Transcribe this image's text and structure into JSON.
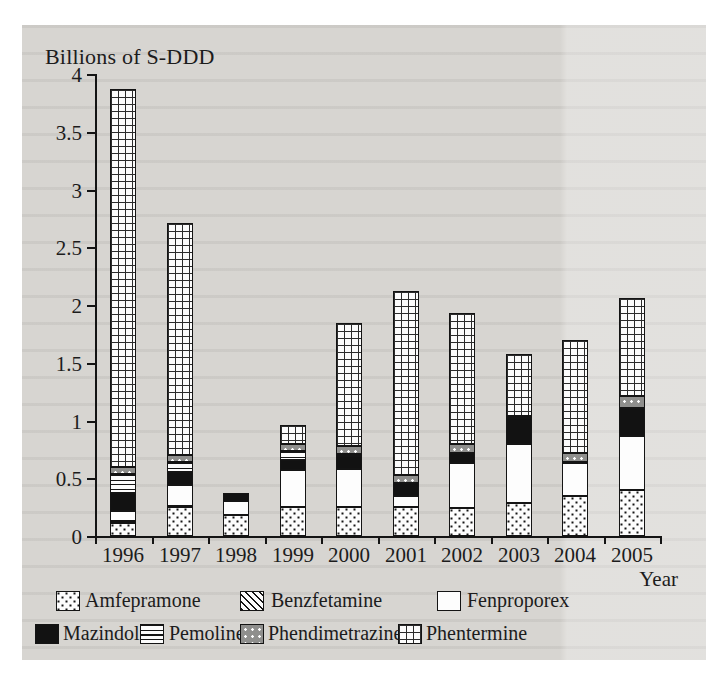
{
  "page": {
    "yaxis_title": "Billions of S-DDD",
    "xaxis_title": "Year"
  },
  "chart_data": {
    "type": "bar",
    "stacked": true,
    "title": "Billions of S-DDD",
    "xlabel": "Year",
    "ylabel": "Billions of S-DDD",
    "ylim": [
      0,
      4
    ],
    "yticks": [
      "0",
      "0.5",
      "1",
      "1.5",
      "2",
      "2.5",
      "3",
      "3.5",
      "4"
    ],
    "grid": false,
    "legend_position": "bottom",
    "categories": [
      "1996",
      "1997",
      "1998",
      "1999",
      "2000",
      "2001",
      "2002",
      "2003",
      "2004",
      "2005"
    ],
    "series": [
      {
        "name": "Amfepramone",
        "pattern": "dots-black-on-white",
        "values": [
          0.11,
          0.25,
          0.18,
          0.25,
          0.25,
          0.25,
          0.24,
          0.29,
          0.35,
          0.4
        ]
      },
      {
        "name": "Benzfetamine",
        "pattern": "diagonal-hatch",
        "values": [
          0.02,
          0.01,
          0,
          0,
          0,
          0,
          0,
          0,
          0,
          0
        ]
      },
      {
        "name": "Fenproporex",
        "pattern": "white",
        "values": [
          0.09,
          0.18,
          0.12,
          0.32,
          0.33,
          0.1,
          0.39,
          0.51,
          0.28,
          0.47
        ]
      },
      {
        "name": "Mazindol",
        "pattern": "solid-black",
        "values": [
          0.15,
          0.11,
          0.07,
          0.09,
          0.11,
          0.11,
          0.09,
          0.22,
          0.01,
          0.24
        ]
      },
      {
        "name": "Pemoline",
        "pattern": "horizontal-lines",
        "values": [
          0.17,
          0.09,
          0,
          0.08,
          0.02,
          0,
          0,
          0,
          0,
          0
        ]
      },
      {
        "name": "Phendimetrazine",
        "pattern": "gray-white-dots",
        "values": [
          0.06,
          0.06,
          0,
          0.06,
          0.07,
          0.07,
          0.08,
          0.02,
          0.08,
          0.1
        ]
      },
      {
        "name": "Phentermine",
        "pattern": "grid",
        "values": [
          3.27,
          2.01,
          0,
          0.16,
          1.06,
          1.59,
          1.13,
          0.54,
          0.98,
          0.85
        ]
      }
    ],
    "totals": [
      3.87,
      2.71,
      0.37,
      0.96,
      1.84,
      2.12,
      1.93,
      1.58,
      1.7,
      2.06
    ]
  }
}
